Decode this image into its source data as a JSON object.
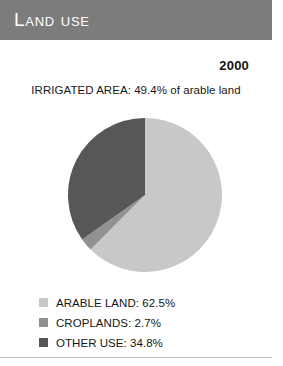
{
  "header": {
    "title": "LAND USE",
    "bar_color": "#7c7c7c"
  },
  "year": "2000",
  "subtitle": "IRRIGATED AREA: 49.4% of arable land",
  "legend": {
    "items": [
      {
        "label": "ARABLE LAND: 62.5%",
        "color": "#c8c8c8"
      },
      {
        "label": "CROPLANDS: 2.7%",
        "color": "#919191"
      },
      {
        "label": "OTHER USE: 34.8%",
        "color": "#575757"
      }
    ]
  },
  "chart_data": {
    "type": "pie",
    "title": "LAND USE",
    "subtitle": "IRRIGATED AREA: 49.4% of arable land",
    "year": "2000",
    "categories": [
      "ARABLE LAND",
      "CROPLANDS",
      "OTHER USE"
    ],
    "values": [
      62.5,
      2.7,
      34.8
    ],
    "unit": "%",
    "colors": [
      "#c8c8c8",
      "#919191",
      "#575757"
    ],
    "legend_position": "bottom",
    "grid": false,
    "start_angle_deg": 0,
    "direction": "clockwise",
    "slices": [
      {
        "label": "ARABLE LAND",
        "value": 62.5,
        "color": "#c8c8c8"
      },
      {
        "label": "CROPLANDS",
        "value": 2.7,
        "color": "#919191"
      },
      {
        "label": "OTHER USE",
        "value": 34.8,
        "color": "#575757"
      }
    ],
    "annotations": [
      "IRRIGATED AREA: 49.4% of arable land"
    ]
  }
}
